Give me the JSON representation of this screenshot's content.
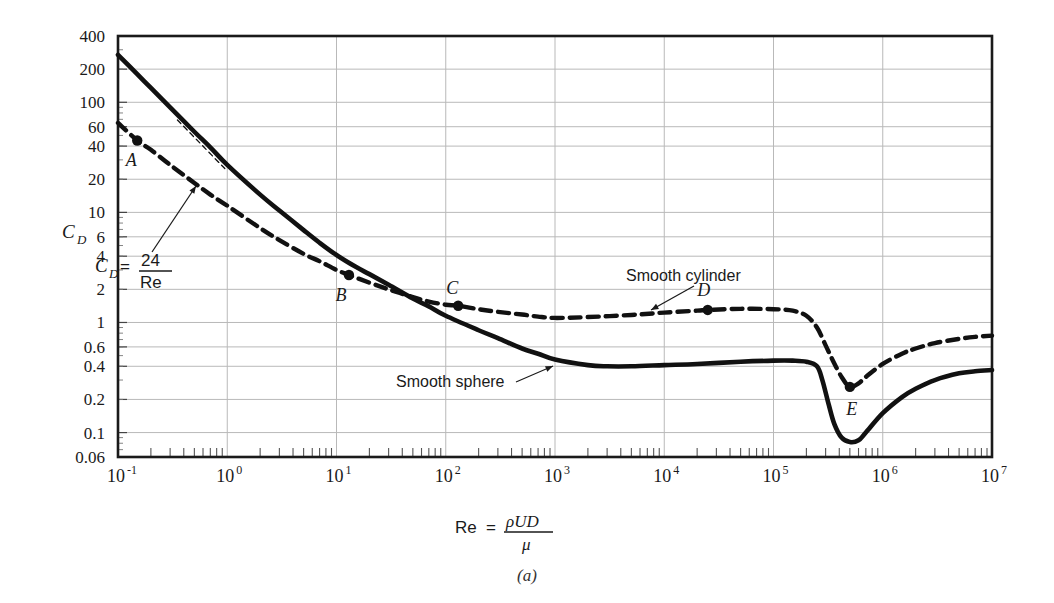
{
  "figure": {
    "caption": "(a)",
    "background": "#ffffff",
    "ink_color": "#111111"
  },
  "axes": {
    "x": {
      "label_prefix": "Re",
      "label_equals": "=",
      "label_numerator": "ρUD",
      "label_denominator": "μ",
      "scale": "log",
      "min": 0.1,
      "max": 10000000,
      "tick_mantissa": "10",
      "tick_exponents": [
        "-1",
        "0",
        "1",
        "2",
        "3",
        "4",
        "5",
        "6",
        "7"
      ],
      "tick_values": [
        0.1,
        1,
        10,
        100,
        1000,
        10000,
        100000,
        1000000,
        10000000
      ]
    },
    "y": {
      "label": "C",
      "label_sub": "D",
      "scale": "log",
      "min": 0.06,
      "max": 400,
      "ticks": [
        400,
        200,
        100,
        60,
        40,
        20,
        10,
        6,
        4,
        2,
        1,
        0.6,
        0.4,
        0.2,
        0.1,
        0.06
      ],
      "tick_labels": [
        "400",
        "200",
        "100",
        "60",
        "40",
        "20",
        "10",
        "6",
        "4",
        "2",
        "1",
        "0.6",
        "0.4",
        "0.2",
        "0.1",
        "0.06"
      ]
    },
    "grid": "major-only"
  },
  "chart_data": {
    "type": "line",
    "title": "",
    "xlabel": "Re = ρUD/μ",
    "ylabel": "C_D",
    "xscale": "log",
    "yscale": "log",
    "xlim": [
      0.1,
      10000000
    ],
    "ylim": [
      0.06,
      400
    ],
    "grid": true,
    "legend": "inline-annotations",
    "series": [
      {
        "name": "Smooth sphere",
        "style": "solid",
        "points": [
          [
            0.1,
            270
          ],
          [
            0.15,
            180
          ],
          [
            0.2,
            135
          ],
          [
            0.3,
            90
          ],
          [
            0.5,
            54
          ],
          [
            0.7,
            39
          ],
          [
            1.0,
            27
          ],
          [
            2.0,
            14.5
          ],
          [
            3.0,
            10.4
          ],
          [
            5.0,
            6.9
          ],
          [
            7.0,
            5.3
          ],
          [
            10,
            4.1
          ],
          [
            15,
            3.2
          ],
          [
            20,
            2.75
          ],
          [
            30,
            2.2
          ],
          [
            50,
            1.65
          ],
          [
            70,
            1.4
          ],
          [
            100,
            1.15
          ],
          [
            200,
            0.85
          ],
          [
            300,
            0.72
          ],
          [
            500,
            0.58
          ],
          [
            700,
            0.52
          ],
          [
            1000,
            0.46
          ],
          [
            2000,
            0.41
          ],
          [
            3000,
            0.4
          ],
          [
            5000,
            0.4
          ],
          [
            10000,
            0.41
          ],
          [
            20000,
            0.42
          ],
          [
            50000,
            0.44
          ],
          [
            100000,
            0.45
          ],
          [
            150000,
            0.45
          ],
          [
            200000,
            0.44
          ],
          [
            250000,
            0.4
          ],
          [
            280000,
            0.3
          ],
          [
            320000,
            0.18
          ],
          [
            360000,
            0.12
          ],
          [
            420000,
            0.09
          ],
          [
            500000,
            0.082
          ],
          [
            600000,
            0.085
          ],
          [
            700000,
            0.1
          ],
          [
            1000000,
            0.15
          ],
          [
            1500000,
            0.21
          ],
          [
            2000000,
            0.25
          ],
          [
            3000000,
            0.3
          ],
          [
            5000000,
            0.345
          ],
          [
            7000000,
            0.36
          ],
          [
            10000000,
            0.37
          ]
        ]
      },
      {
        "name": "Smooth cylinder",
        "style": "dashed",
        "points": [
          [
            0.1,
            65
          ],
          [
            0.15,
            45
          ],
          [
            0.2,
            37
          ],
          [
            0.3,
            27
          ],
          [
            0.5,
            18.5
          ],
          [
            0.7,
            14.5
          ],
          [
            1.0,
            11.5
          ],
          [
            2.0,
            7.2
          ],
          [
            3.0,
            5.6
          ],
          [
            5.0,
            4.2
          ],
          [
            7.0,
            3.6
          ],
          [
            10,
            3.0
          ],
          [
            13,
            2.7
          ],
          [
            20,
            2.3
          ],
          [
            30,
            2.0
          ],
          [
            50,
            1.7
          ],
          [
            70,
            1.55
          ],
          [
            100,
            1.45
          ],
          [
            130,
            1.42
          ],
          [
            200,
            1.32
          ],
          [
            300,
            1.25
          ],
          [
            500,
            1.18
          ],
          [
            700,
            1.13
          ],
          [
            1000,
            1.1
          ],
          [
            2000,
            1.12
          ],
          [
            5000,
            1.17
          ],
          [
            10000,
            1.23
          ],
          [
            20000,
            1.28
          ],
          [
            25000,
            1.3
          ],
          [
            50000,
            1.33
          ],
          [
            100000,
            1.32
          ],
          [
            150000,
            1.28
          ],
          [
            200000,
            1.15
          ],
          [
            250000,
            0.9
          ],
          [
            300000,
            0.62
          ],
          [
            350000,
            0.45
          ],
          [
            420000,
            0.32
          ],
          [
            500000,
            0.26
          ],
          [
            600000,
            0.28
          ],
          [
            700000,
            0.32
          ],
          [
            1000000,
            0.42
          ],
          [
            1500000,
            0.52
          ],
          [
            2000000,
            0.58
          ],
          [
            3000000,
            0.65
          ],
          [
            5000000,
            0.71
          ],
          [
            7000000,
            0.74
          ],
          [
            10000000,
            0.76
          ]
        ]
      },
      {
        "name": "Stokes law reference",
        "style": "thin-dashed",
        "points": [
          [
            0.35,
            69
          ],
          [
            0.95,
            25
          ]
        ]
      }
    ],
    "markers": [
      {
        "label": "A",
        "x": 0.15,
        "y": 45,
        "label_dx": -6,
        "label_dy": 26
      },
      {
        "label": "B",
        "x": 13,
        "y": 2.7,
        "label_dx": -8,
        "label_dy": 26
      },
      {
        "label": "C",
        "x": 130,
        "y": 1.42,
        "label_dx": -6,
        "label_dy": -12
      },
      {
        "label": "D",
        "x": 25000,
        "y": 1.3,
        "label_dx": -4,
        "label_dy": -14
      },
      {
        "label": "E",
        "x": 500000,
        "y": 0.26,
        "label_dx": 2,
        "label_dy": 28
      }
    ],
    "annotations": [
      {
        "name": "stokes-law",
        "text": "C_D = 24/Re",
        "text_main": "C",
        "text_sub": "D",
        "text_eq": "=",
        "numerator": "24",
        "denominator": "Re"
      },
      {
        "name": "smooth-cylinder-label",
        "text": "Smooth cylinder"
      },
      {
        "name": "smooth-sphere-label",
        "text": "Smooth sphere"
      }
    ]
  },
  "labels": {
    "smooth_cylinder": "Smooth cylinder",
    "smooth_sphere": "Smooth sphere",
    "stokes_cd": "C",
    "stokes_sub": "D",
    "stokes_eq": "=",
    "stokes_num": "24",
    "stokes_den": "Re"
  }
}
